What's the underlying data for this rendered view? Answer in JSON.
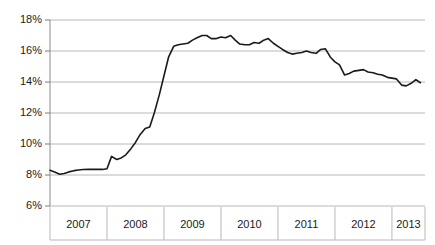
{
  "chart_data": {
    "type": "line",
    "title": "",
    "xlabel": "",
    "ylabel": "",
    "ylim": [
      6,
      18
    ],
    "xlim": [
      2007.0,
      2013.58
    ],
    "grid": true,
    "legend": null,
    "y_ticks": [
      "6%",
      "8%",
      "10%",
      "12%",
      "14%",
      "16%",
      "18%"
    ],
    "y_tick_values": [
      6,
      8,
      10,
      12,
      14,
      16,
      18
    ],
    "x_tick_labels": [
      "2007",
      "2008",
      "2009",
      "2010",
      "2011",
      "2012",
      "2013"
    ],
    "series": [
      {
        "name": "rate",
        "color": "#1a1a1a",
        "x": [
          2007.0,
          2007.08,
          2007.17,
          2007.25,
          2007.33,
          2007.42,
          2007.5,
          2007.58,
          2007.67,
          2007.75,
          2007.83,
          2007.92,
          2008.0,
          2008.08,
          2008.17,
          2008.25,
          2008.33,
          2008.42,
          2008.5,
          2008.58,
          2008.67,
          2008.75,
          2008.83,
          2008.92,
          2009.0,
          2009.08,
          2009.17,
          2009.25,
          2009.33,
          2009.42,
          2009.5,
          2009.58,
          2009.67,
          2009.75,
          2009.83,
          2009.92,
          2010.0,
          2010.08,
          2010.17,
          2010.25,
          2010.33,
          2010.42,
          2010.5,
          2010.58,
          2010.67,
          2010.75,
          2010.83,
          2010.92,
          2011.0,
          2011.08,
          2011.17,
          2011.25,
          2011.33,
          2011.42,
          2011.5,
          2011.58,
          2011.67,
          2011.75,
          2011.83,
          2011.92,
          2012.0,
          2012.08,
          2012.17,
          2012.25,
          2012.33,
          2012.42,
          2012.5,
          2012.58,
          2012.67,
          2012.75,
          2012.83,
          2012.92,
          2013.0,
          2013.08,
          2013.17,
          2013.25,
          2013.33,
          2013.42,
          2013.5
        ],
        "y": [
          8.3,
          8.2,
          8.05,
          8.1,
          8.2,
          8.28,
          8.32,
          8.35,
          8.36,
          8.36,
          8.36,
          8.36,
          8.4,
          9.2,
          9.0,
          9.1,
          9.3,
          9.7,
          10.1,
          10.6,
          11.0,
          11.1,
          12.0,
          13.2,
          14.4,
          15.6,
          16.3,
          16.4,
          16.45,
          16.5,
          16.7,
          16.85,
          17.0,
          17.0,
          16.8,
          16.8,
          16.9,
          16.85,
          17.0,
          16.7,
          16.45,
          16.4,
          16.4,
          16.55,
          16.5,
          16.7,
          16.8,
          16.5,
          16.3,
          16.1,
          15.9,
          15.8,
          15.85,
          15.9,
          16.0,
          15.9,
          15.85,
          16.1,
          16.15,
          15.6,
          15.3,
          15.1,
          14.45,
          14.55,
          14.7,
          14.75,
          14.8,
          14.65,
          14.6,
          14.5,
          14.45,
          14.3,
          14.25,
          14.2,
          13.8,
          13.75,
          13.9,
          14.15,
          13.95
        ]
      }
    ]
  },
  "axes": {
    "y_labels": [
      {
        "text": "18%",
        "value": 18
      },
      {
        "text": "16%",
        "value": 16
      },
      {
        "text": "14%",
        "value": 14
      },
      {
        "text": "12%",
        "value": 12
      },
      {
        "text": "10%",
        "value": 10
      },
      {
        "text": "8%",
        "value": 8
      },
      {
        "text": "6%",
        "value": 6
      }
    ],
    "x_labels": [
      {
        "text": "2007"
      },
      {
        "text": "2008"
      },
      {
        "text": "2009"
      },
      {
        "text": "2010"
      },
      {
        "text": "2011"
      },
      {
        "text": "2012"
      },
      {
        "text": "2013"
      }
    ]
  },
  "colors": {
    "line": "#1a1a1a",
    "grid": "#b8b8b8",
    "axis": "#7a7a7a",
    "background": "#ffffff",
    "text": "#1a1a1a"
  }
}
